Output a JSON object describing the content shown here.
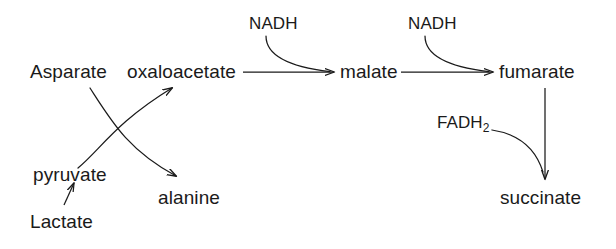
{
  "diagram": {
    "background_color": "#ffffff",
    "stroke_color": "#1a1a1a",
    "text_color": "#1a1a1a",
    "nodes": [
      {
        "id": "asparate",
        "label": "Asparate",
        "x": 30,
        "y": 62
      },
      {
        "id": "oxaloacetate",
        "label": "oxaloacetate",
        "x": 127,
        "y": 62
      },
      {
        "id": "malate",
        "label": "malate",
        "x": 340,
        "y": 62
      },
      {
        "id": "fumarate",
        "label": "fumarate",
        "x": 499,
        "y": 62
      },
      {
        "id": "pyruvate",
        "label": "pyruvate",
        "x": 33,
        "y": 165
      },
      {
        "id": "alanine",
        "label": "alanine",
        "x": 158,
        "y": 188
      },
      {
        "id": "lactate",
        "label": "Lactate",
        "x": 30,
        "y": 212
      },
      {
        "id": "succinate",
        "label": "succinate",
        "x": 500,
        "y": 188
      }
    ],
    "cofactors": [
      {
        "id": "nadh-1",
        "label": "NADH",
        "x": 249,
        "y": 15
      },
      {
        "id": "nadh-2",
        "label": "NADH",
        "x": 408,
        "y": 15
      },
      {
        "id": "fadh2",
        "label": "FADH",
        "sub": "2",
        "x": 437,
        "y": 114
      }
    ],
    "edges": [
      {
        "id": "oxaloacetate-to-malate",
        "from": "oxaloacetate",
        "to": "malate",
        "kind": "straight-arrow"
      },
      {
        "id": "malate-to-fumarate",
        "from": "malate",
        "to": "fumarate",
        "kind": "straight-arrow"
      },
      {
        "id": "fumarate-to-succinate",
        "from": "fumarate",
        "to": "succinate",
        "kind": "straight-arrow"
      },
      {
        "id": "pyruvate-to-oxaloacetate",
        "from": "pyruvate",
        "to": "oxaloacetate",
        "kind": "curved-arrow"
      },
      {
        "id": "asparate-to-alanine",
        "from": "asparate",
        "to": "alanine",
        "kind": "curved-arrow"
      },
      {
        "id": "lactate-to-pyruvate",
        "from": "lactate",
        "to": "pyruvate",
        "kind": "straight-arrow"
      },
      {
        "id": "nadh-1-to-malate",
        "from": "nadh-1",
        "to": "malate",
        "kind": "curved-merge"
      },
      {
        "id": "nadh-2-to-fumarate",
        "from": "nadh-2",
        "to": "fumarate",
        "kind": "curved-merge"
      },
      {
        "id": "fadh2-to-succinate",
        "from": "fadh2",
        "to": "succinate",
        "kind": "curved-merge"
      }
    ]
  }
}
